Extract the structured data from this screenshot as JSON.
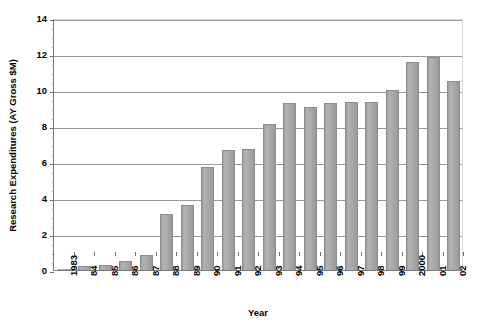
{
  "chart_data": {
    "type": "bar",
    "title": "",
    "xlabel": "Year",
    "ylabel": "Research Expenditures (AY Gross $M)",
    "categories": [
      "1983",
      "84",
      "85",
      "86",
      "87",
      "88",
      "89",
      "90",
      "91",
      "92",
      "93",
      "94",
      "95",
      "96",
      "97",
      "98",
      "99",
      "2000",
      "01",
      "02"
    ],
    "values": [
      0.05,
      0.2,
      0.3,
      0.5,
      0.85,
      3.1,
      3.6,
      5.7,
      6.65,
      6.7,
      8.1,
      9.3,
      9.05,
      9.3,
      9.35,
      9.35,
      10.0,
      11.55,
      11.85,
      10.5
    ],
    "ylim": [
      0,
      14
    ],
    "ytick_labels": [
      "0",
      "2",
      "4",
      "6",
      "8",
      "10",
      "12",
      "14"
    ],
    "ytick_values": [
      0,
      2,
      4,
      6,
      8,
      10,
      12,
      14
    ],
    "yminor_step": 0.5,
    "grid": "horizontal",
    "legend": "none",
    "bar_color": "#a9a9a9",
    "bar_border_color": "#8c8c8c",
    "gridline_color": "#9a9a9a",
    "axis_color": "#7a7a7a",
    "series": [
      {
        "name": "Research Expenditures (AY Gross $M)",
        "values": [
          0.05,
          0.2,
          0.3,
          0.5,
          0.85,
          3.1,
          3.6,
          5.7,
          6.65,
          6.7,
          8.1,
          9.3,
          9.05,
          9.3,
          9.35,
          9.35,
          10.0,
          11.55,
          11.85,
          10.5
        ]
      }
    ]
  }
}
